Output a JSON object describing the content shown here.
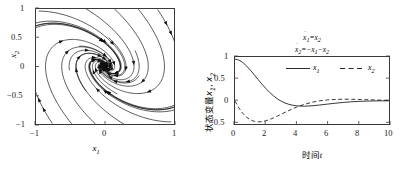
{
  "figure": {
    "panels": [
      {
        "id": "phase-portrait",
        "xlabel": "x",
        "xlabel_sub": "1",
        "ylabel": "x",
        "ylabel_sub": "2",
        "xticks": [
          "−1",
          "0",
          "1"
        ],
        "yticks": [
          "1",
          "0.5",
          "0",
          "−0.5",
          "−1"
        ]
      },
      {
        "id": "time-response",
        "xlabel": "时间",
        "xlabel_italic": "t",
        "ylabel": "状态变量",
        "ylabel_sym1": "x",
        "ylabel_sym1_sub": "1",
        "ylabel_sep": ", ",
        "ylabel_sym2": "x",
        "ylabel_sym2_sub": "2",
        "xticks": [
          "0",
          "2",
          "4",
          "6",
          "8",
          "10"
        ],
        "yticks": [
          "1",
          "0.5",
          "0",
          "−0.5"
        ],
        "equation_line1_lhs": "x",
        "equation_line1_lhs_sub": "1",
        "equation_line1_rhs": "=x",
        "equation_line1_rhs_sub": "2",
        "equation_line2_lhs": "x",
        "equation_line2_lhs_sub": "2",
        "equation_line2_rhs": "=−x",
        "equation_line2_rhs_sub": "1",
        "equation_line2_rhs2": "−x",
        "equation_line2_rhs2_sub": "2",
        "legend": [
          {
            "label": "x",
            "sub": "1",
            "style": "solid"
          },
          {
            "label": "x",
            "sub": "2",
            "style": "dashed"
          }
        ]
      }
    ]
  },
  "colors": {
    "line": "#111111",
    "frame": "#3a3a3a",
    "background": "#ffffff"
  },
  "chart_data": [
    {
      "type": "line",
      "id": "phase-portrait",
      "title": "",
      "xlabel": "x1",
      "ylabel": "x2",
      "xlim": [
        -1,
        1
      ],
      "ylim": [
        -1,
        1
      ],
      "xticks": [
        -1,
        0,
        1
      ],
      "yticks": [
        -1,
        -0.5,
        0,
        0.5,
        1
      ],
      "grid": false,
      "legend": "none",
      "description": "Stable focus (spiral sink) phase portrait of x1'=x2, x2'=-x1-x2; trajectories spiral clockwise into the origin with direction arrows on each streamline.",
      "system": {
        "x1_dot": "x2",
        "x2_dot": "-x1-x2"
      },
      "equilibrium": [
        0,
        0
      ],
      "eigenvalues": [
        "-0.5+0.866i",
        "-0.5-0.866i"
      ],
      "n_streamlines": 20,
      "arrow_direction": "clockwise-inward"
    },
    {
      "type": "line",
      "id": "time-response",
      "title": "",
      "xlabel": "时间t",
      "ylabel": "状态变量x1, x2",
      "xlim": [
        0,
        10
      ],
      "ylim": [
        -0.55,
        1.05
      ],
      "xticks": [
        0,
        2,
        4,
        6,
        8,
        10
      ],
      "yticks": [
        -0.5,
        0,
        0.5,
        1
      ],
      "grid": false,
      "legend": "inside-top-right",
      "x": [
        0,
        0.25,
        0.5,
        0.75,
        1,
        1.25,
        1.5,
        1.75,
        2,
        2.25,
        2.5,
        2.75,
        3,
        3.25,
        3.5,
        3.75,
        4,
        4.5,
        5,
        5.5,
        6,
        6.5,
        7,
        7.5,
        8,
        8.5,
        9,
        9.5,
        10
      ],
      "series": [
        {
          "name": "x1",
          "style": "solid",
          "values": [
            1,
            0.978,
            0.92,
            0.836,
            0.735,
            0.625,
            0.512,
            0.402,
            0.298,
            0.204,
            0.122,
            0.052,
            -0.005,
            -0.049,
            -0.081,
            -0.103,
            -0.116,
            -0.124,
            -0.115,
            -0.097,
            -0.075,
            -0.054,
            -0.036,
            -0.021,
            -0.011,
            -0.004,
            0.001,
            0.003,
            0.004
          ]
        },
        {
          "name": "x2",
          "style": "dashed",
          "values": [
            0,
            -0.166,
            -0.295,
            -0.389,
            -0.451,
            -0.486,
            -0.499,
            -0.493,
            -0.473,
            -0.442,
            -0.404,
            -0.361,
            -0.316,
            -0.271,
            -0.227,
            -0.185,
            -0.147,
            -0.081,
            -0.031,
            0.003,
            0.025,
            0.037,
            0.041,
            0.041,
            0.037,
            0.031,
            0.025,
            0.019,
            0.014
          ]
        }
      ]
    }
  ]
}
